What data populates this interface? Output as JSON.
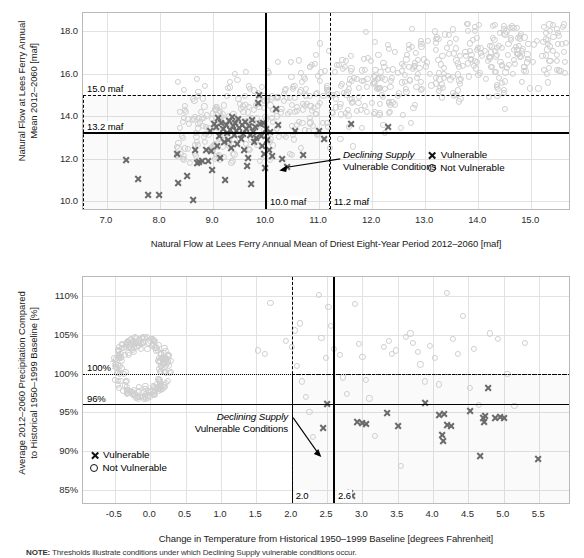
{
  "chart_data": [
    {
      "id": "supply",
      "type": "scatter",
      "title": "",
      "xlabel": "Natural Flow at Lees Ferry Annual Mean of Driest Eight-Year Period 2012–2060 [maf]",
      "ylabel": "Natural Flow at Lees Ferry Annual Mean 2012–2060 [maf]",
      "ylabel_lines": [
        "Natural Flow at Lees Ferry Annual",
        "Mean 2012–2060 [maf]"
      ],
      "xlim": [
        6.55,
        15.75
      ],
      "ylim": [
        9.55,
        18.85
      ],
      "xticks": [
        7.0,
        8.0,
        9.0,
        10.0,
        11.0,
        12.0,
        13.0,
        14.0,
        15.0
      ],
      "xticklabels": [
        "7.0",
        "8.0",
        "9.0",
        "10.0",
        "11.0",
        "12.0",
        "13.0",
        "14.0",
        "15.0"
      ],
      "yticks": [
        10.0,
        12.0,
        14.0,
        16.0,
        18.0
      ],
      "yticklabels": [
        "10.0",
        "12.0",
        "14.0",
        "16.0",
        "18.0"
      ],
      "grid": true,
      "thresholds": [
        {
          "axis": "y",
          "value": 13.2,
          "style": "solid",
          "label": "13.2 maf"
        },
        {
          "axis": "x",
          "value": 10.0,
          "style": "solid",
          "label": "10.0 maf"
        },
        {
          "axis": "y",
          "value": 15.0,
          "style": "dashed",
          "label": "15.0 maf"
        },
        {
          "axis": "x",
          "value": 11.2,
          "style": "dashed",
          "label": "11.2 maf"
        }
      ],
      "vulnerable_box": {
        "x0": 6.55,
        "x1": 11.2,
        "y0": 9.55,
        "y1": 15.0
      },
      "annotation": {
        "line1": "Declining Supply",
        "line2": "Vulnerable Conditions"
      },
      "legend": {
        "position": "inside-right",
        "entries": [
          {
            "marker": "x",
            "label": "Vulnerable"
          },
          {
            "marker": "o",
            "label": "Not Vulnerable"
          }
        ]
      },
      "series": [
        {
          "name": "Vulnerable",
          "marker": "x",
          "color": "#6b6b6b",
          "points": [
            [
              7.36,
              11.95
            ],
            [
              7.58,
              11.07
            ],
            [
              7.78,
              10.28
            ],
            [
              7.98,
              10.28
            ],
            [
              8.32,
              12.23
            ],
            [
              8.35,
              10.88
            ],
            [
              8.52,
              11.18
            ],
            [
              8.62,
              10.05
            ],
            [
              8.66,
              12.42
            ],
            [
              8.7,
              11.8
            ],
            [
              8.74,
              11.86
            ],
            [
              8.8,
              11.92
            ],
            [
              8.86,
              12.43
            ],
            [
              8.9,
              11.92
            ],
            [
              8.95,
              13.3
            ],
            [
              8.97,
              12.35
            ],
            [
              8.99,
              11.46
            ],
            [
              9.02,
              13.62
            ],
            [
              9.05,
              13.48
            ],
            [
              9.07,
              12.62
            ],
            [
              9.09,
              13.9
            ],
            [
              9.12,
              13.05
            ],
            [
              9.14,
              12.06
            ],
            [
              9.16,
              13.7
            ],
            [
              9.18,
              13.42
            ],
            [
              9.2,
              12.78
            ],
            [
              9.22,
              11.02
            ],
            [
              9.24,
              13.58
            ],
            [
              9.26,
              13.2
            ],
            [
              9.28,
              12.88
            ],
            [
              9.3,
              13.78
            ],
            [
              9.32,
              13.35
            ],
            [
              9.34,
              12.52
            ],
            [
              9.36,
              13.95
            ],
            [
              9.38,
              13.52
            ],
            [
              9.4,
              13.12
            ],
            [
              9.42,
              13.68
            ],
            [
              9.44,
              13.3
            ],
            [
              9.46,
              12.7
            ],
            [
              9.48,
              13.85
            ],
            [
              9.5,
              13.45
            ],
            [
              9.52,
              12.95
            ],
            [
              9.54,
              13.6
            ],
            [
              9.56,
              13.18
            ],
            [
              9.58,
              12.42
            ],
            [
              9.6,
              13.75
            ],
            [
              9.62,
              13.38
            ],
            [
              9.64,
              11.68
            ],
            [
              9.66,
              12.06
            ],
            [
              9.68,
              13.55
            ],
            [
              9.7,
              13.1
            ],
            [
              9.72,
              10.82
            ],
            [
              9.74,
              13.82
            ],
            [
              9.76,
              13.28
            ],
            [
              9.78,
              12.8
            ],
            [
              9.8,
              13.48
            ],
            [
              9.82,
              12.98
            ],
            [
              9.84,
              14.62
            ],
            [
              9.86,
              14.98
            ],
            [
              9.88,
              13.62
            ],
            [
              9.9,
              13.08
            ],
            [
              9.92,
              12.58
            ],
            [
              9.94,
              13.7
            ],
            [
              9.96,
              12.22
            ],
            [
              9.98,
              11.55
            ],
            [
              10.0,
              13.4
            ],
            [
              10.02,
              12.9
            ],
            [
              10.05,
              12.4
            ],
            [
              10.08,
              13.25
            ],
            [
              10.12,
              12.12
            ],
            [
              10.18,
              14.32
            ],
            [
              10.22,
              13.58
            ],
            [
              10.3,
              12.0
            ],
            [
              10.4,
              11.6
            ],
            [
              10.55,
              13.32
            ],
            [
              10.7,
              12.18
            ],
            [
              11.0,
              13.3
            ],
            [
              11.1,
              12.95
            ],
            [
              11.6,
              13.62
            ],
            [
              12.3,
              13.5
            ]
          ]
        },
        {
          "name": "Not Vulnerable",
          "marker": "o",
          "color": "#cfcfcf",
          "description": "Large light-gray cloud of circles spanning roughly x 8.3-15.6, y 11.8-18.3, densest between x 10.5-14.0 and y 13.2-16.2",
          "cloud": {
            "x_range": [
              8.3,
              15.65
            ],
            "y_range": [
              11.75,
              18.35
            ],
            "count": 620,
            "trend_slope": 0.62,
            "trend_intercept": 7.9,
            "y_scatter": 1.05
          },
          "points": [
            [
              8.34,
              15.62
            ],
            [
              8.38,
              14.22
            ],
            [
              8.62,
              13.85
            ],
            [
              8.95,
              12.48
            ],
            [
              9.1,
              12.55
            ],
            [
              9.42,
              15.98
            ],
            [
              9.62,
              16.08
            ],
            [
              9.7,
              15.3
            ],
            [
              10.05,
              16.02
            ],
            [
              10.22,
              16.55
            ],
            [
              10.48,
              15.85
            ],
            [
              10.62,
              16.62
            ],
            [
              11.02,
              17.42
            ],
            [
              11.18,
              17.08
            ],
            [
              11.45,
              16.22
            ],
            [
              11.88,
              17.98
            ],
            [
              12.3,
              17.35
            ],
            [
              12.75,
              18.12
            ],
            [
              13.2,
              17.62
            ],
            [
              13.55,
              16.95
            ],
            [
              14.02,
              18.28
            ],
            [
              14.45,
              17.22
            ],
            [
              14.8,
              17.85
            ],
            [
              15.1,
              17.55
            ],
            [
              15.35,
              17.28
            ],
            [
              15.52,
              16.15
            ]
          ]
        }
      ]
    },
    {
      "id": "climate",
      "type": "scatter",
      "title": "",
      "xlabel": "Change in Temperature from Historical 1950–1999 Baseline [degrees Fahrenheit]",
      "ylabel": "Average 2012–2060 Precipitation Compared to Historical 1950–1999 Baseline [%]",
      "ylabel_lines": [
        "Average 2012–2060 Precipitation Compared",
        "to Historical 1950–1999 Baseline [%]"
      ],
      "xlim": [
        -0.95,
        5.95
      ],
      "ylim": [
        83.0,
        112.5
      ],
      "xticks": [
        -0.5,
        0.0,
        0.5,
        1.0,
        1.5,
        2.0,
        2.5,
        3.0,
        3.5,
        4.0,
        4.5,
        5.0,
        5.5
      ],
      "xticklabels": [
        "-0.5",
        "0.0",
        "0.5",
        "1.0",
        "1.5",
        "2.0",
        "2.5",
        "3.0",
        "3.5",
        "4.0",
        "4.5",
        "5.0",
        "5.5"
      ],
      "yticks": [
        85,
        90,
        95,
        100,
        105,
        110
      ],
      "yticklabels": [
        "85%",
        "90%",
        "95%",
        "100%",
        "105%",
        "110%"
      ],
      "grid": true,
      "thresholds": [
        {
          "axis": "y",
          "value": 96,
          "style": "solid",
          "label": "96%"
        },
        {
          "axis": "x",
          "value": 2.6,
          "style": "solid",
          "label": "2.6"
        },
        {
          "axis": "y",
          "value": 100,
          "style": "dotted",
          "label": "100%"
        },
        {
          "axis": "x",
          "value": 2.0,
          "style": "dashed",
          "label": "2.0"
        }
      ],
      "vulnerable_box": {
        "x0": 2.0,
        "x1": 5.95,
        "y0": 83.0,
        "y1": 100.0
      },
      "annotation": {
        "line1": "Declining Supply",
        "line2": "Vulnerable Conditions"
      },
      "legend": {
        "position": "inside-left",
        "entries": [
          {
            "marker": "x",
            "label": "Vulnerable"
          },
          {
            "marker": "o",
            "label": "Not Vulnerable"
          }
        ]
      },
      "series": [
        {
          "name": "Vulnerable",
          "marker": "x",
          "color": "#6b6b6b",
          "points": [
            [
              2.5,
              96.1
            ],
            [
              2.45,
              93.0
            ],
            [
              2.82,
              84.6
            ],
            [
              2.86,
              84.2
            ],
            [
              2.92,
              93.7
            ],
            [
              3.0,
              93.6
            ],
            [
              3.05,
              93.5
            ],
            [
              3.35,
              94.9
            ],
            [
              3.5,
              93.2
            ],
            [
              3.88,
              96.2
            ],
            [
              4.08,
              94.7
            ],
            [
              4.12,
              92.1
            ],
            [
              4.14,
              91.3
            ],
            [
              4.16,
              94.8
            ],
            [
              4.2,
              93.3
            ],
            [
              4.26,
              93.2
            ],
            [
              4.52,
              95.1
            ],
            [
              4.66,
              89.3
            ],
            [
              4.7,
              94.2
            ],
            [
              4.72,
              93.7
            ],
            [
              4.74,
              94.5
            ],
            [
              4.78,
              98.2
            ],
            [
              4.88,
              94.3
            ],
            [
              4.94,
              94.4
            ],
            [
              5.0,
              94.2
            ],
            [
              5.48,
              89.0
            ]
          ]
        },
        {
          "name": "Not Vulnerable",
          "marker": "o",
          "color": "#cfcfcf",
          "description": "Dense light-gray ring/cluster near x -0.6 to 0.4, y 96-105; plus scattered circles across x 1.5-5.6, y 88-111",
          "cluster": {
            "center": [
              -0.12,
              100.8
            ],
            "rx": 0.42,
            "ry": 4.1,
            "count": 210,
            "ring": true
          },
          "points": [
            [
              1.52,
              103.0
            ],
            [
              1.62,
              102.6
            ],
            [
              1.7,
              109.2
            ],
            [
              1.92,
              104.2
            ],
            [
              2.0,
              103.5
            ],
            [
              2.05,
              105.6
            ],
            [
              2.08,
              101.0
            ],
            [
              2.12,
              106.5
            ],
            [
              2.15,
              99.0
            ],
            [
              2.2,
              97.0
            ],
            [
              2.25,
              95.0
            ],
            [
              2.3,
              91.8
            ],
            [
              2.38,
              110.2
            ],
            [
              2.42,
              104.6
            ],
            [
              2.48,
              102.0
            ],
            [
              2.52,
              108.6
            ],
            [
              2.55,
              106.2
            ],
            [
              2.6,
              103.2
            ],
            [
              2.68,
              102.4
            ],
            [
              2.72,
              99.5
            ],
            [
              2.78,
              97.4
            ],
            [
              2.9,
              109.0
            ],
            [
              2.95,
              103.8
            ],
            [
              3.0,
              102.2
            ],
            [
              3.05,
              99.2
            ],
            [
              3.1,
              96.8
            ],
            [
              3.18,
              91.9
            ],
            [
              3.3,
              103.5
            ],
            [
              3.38,
              104.2
            ],
            [
              3.42,
              102.6
            ],
            [
              3.48,
              103.0
            ],
            [
              3.55,
              88.1
            ],
            [
              3.62,
              104.8
            ],
            [
              3.68,
              105.2
            ],
            [
              3.72,
              104.0
            ],
            [
              3.78,
              102.8
            ],
            [
              3.82,
              101.2
            ],
            [
              3.88,
              99.0
            ],
            [
              3.95,
              103.6
            ],
            [
              4.02,
              102.0
            ],
            [
              4.08,
              98.6
            ],
            [
              4.2,
              110.4
            ],
            [
              4.28,
              104.5
            ],
            [
              4.35,
              102.5
            ],
            [
              4.42,
              107.5
            ],
            [
              4.52,
              98.2
            ],
            [
              4.58,
              103.2
            ],
            [
              4.65,
              96.0
            ],
            [
              4.8,
              105.2
            ],
            [
              4.92,
              104.5
            ],
            [
              5.05,
              100.0
            ],
            [
              5.15,
              95.8
            ],
            [
              5.3,
              104.0
            ]
          ]
        }
      ]
    }
  ],
  "note": {
    "label": "NOTE:",
    "text": "Thresholds illustrate conditions under which Declining Supply vulnerable conditions occur."
  }
}
